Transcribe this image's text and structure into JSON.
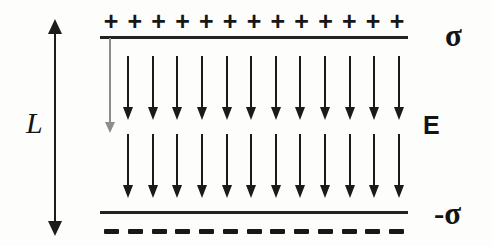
{
  "figure": {
    "type": "physics-diagram",
    "background_color": "#fdfdfc",
    "ink_color": "#1a1a1a",
    "guide_color": "#8d8d8d"
  },
  "plates": {
    "top": {
      "charge_symbol": "+",
      "charge_count": 13,
      "surface_charge_label": "σ"
    },
    "bottom": {
      "charge_symbol": "–",
      "charge_count": 13,
      "surface_charge_label": "-σ"
    }
  },
  "field": {
    "label": "E",
    "direction": "downward",
    "rows": 2,
    "arrows_per_row": 12
  },
  "dimension": {
    "label": "L",
    "description": "plate separation",
    "arrow_style": "double-headed-vertical"
  },
  "labels": {
    "sigma_top": "σ",
    "sigma_bottom": "-σ",
    "field": "E",
    "separation": "L"
  }
}
